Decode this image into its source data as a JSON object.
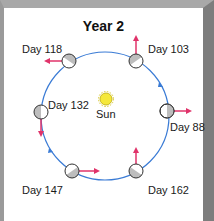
{
  "title": "Year 2",
  "sun_label": "Sun",
  "orbit_color": "#3a7bd5",
  "arrow_color": "#e0336a",
  "positions": [
    {
      "label": "Day 88"
    },
    {
      "label": "Day 103"
    },
    {
      "label": "Day 118"
    },
    {
      "label": "Day 132"
    },
    {
      "label": "Day 147"
    },
    {
      "label": "Day 162"
    }
  ]
}
